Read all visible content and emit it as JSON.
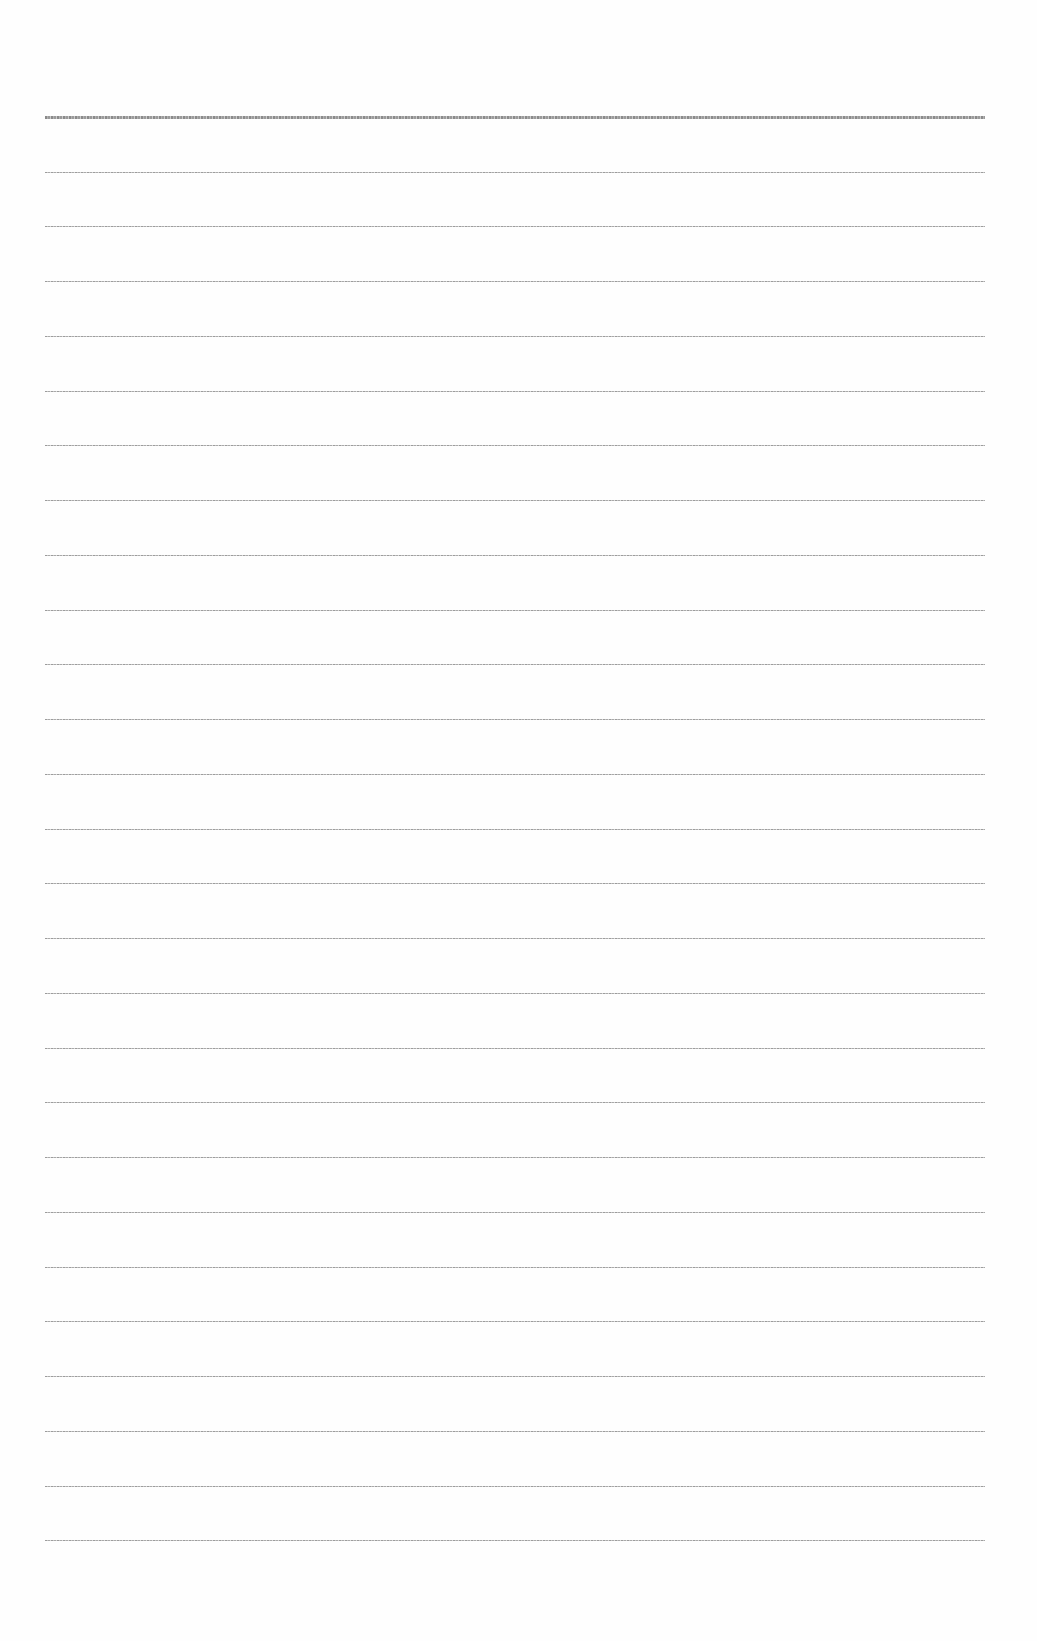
{
  "page": {
    "type": "blank ruled sheet",
    "background_color": "#fefefe",
    "rule_color": "#8a8a8a",
    "rule_count": 27,
    "rule_left_px": 45,
    "rule_width_px": 940,
    "first_rule_y_px": 117,
    "last_rule_y_px": 1540,
    "rules": [
      {
        "y": 117,
        "top": true
      },
      {
        "y": 172
      },
      {
        "y": 226
      },
      {
        "y": 281
      },
      {
        "y": 336
      },
      {
        "y": 391
      },
      {
        "y": 445
      },
      {
        "y": 500
      },
      {
        "y": 555
      },
      {
        "y": 610
      },
      {
        "y": 664
      },
      {
        "y": 719
      },
      {
        "y": 774
      },
      {
        "y": 829
      },
      {
        "y": 883
      },
      {
        "y": 938
      },
      {
        "y": 993
      },
      {
        "y": 1048
      },
      {
        "y": 1102
      },
      {
        "y": 1157
      },
      {
        "y": 1212
      },
      {
        "y": 1267
      },
      {
        "y": 1321
      },
      {
        "y": 1376
      },
      {
        "y": 1431
      },
      {
        "y": 1486
      },
      {
        "y": 1540
      }
    ]
  }
}
